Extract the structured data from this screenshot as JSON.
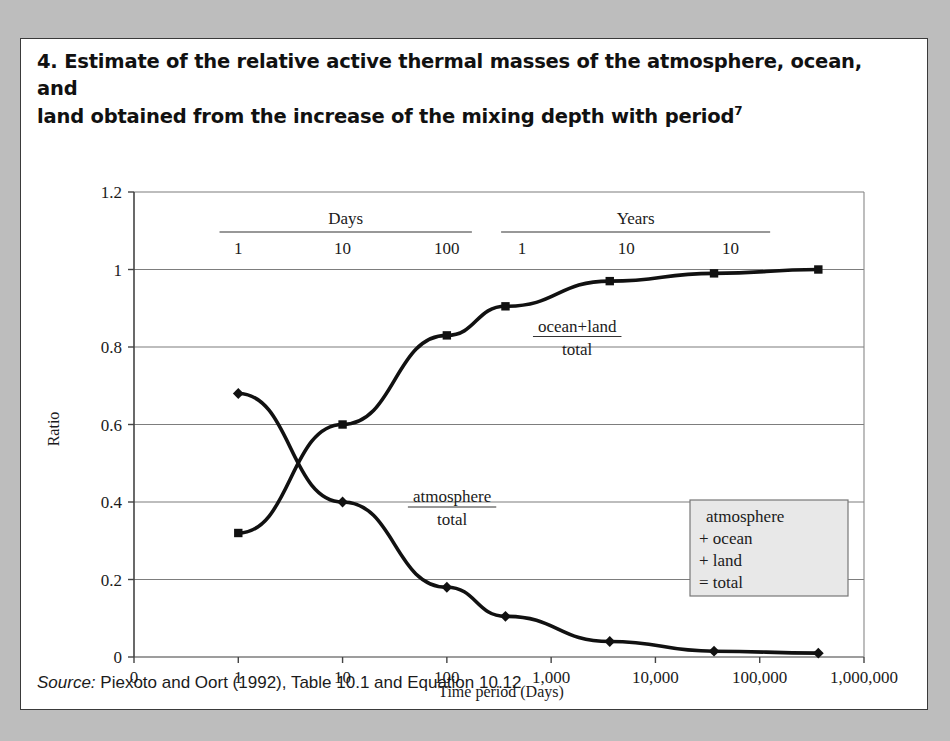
{
  "figure": {
    "number": "4.",
    "title": "4.  Estimate of the relative active thermal masses of the atmosphere, ocean, and land obtained from the increase of the mixing depth with period",
    "title_line1": "4.  Estimate of the relative active thermal masses of the atmosphere, ocean, and",
    "title_line2": "land obtained from the increase of the mixing depth with period",
    "footnote_marker": "7",
    "source_label": "Source:",
    "source_text": " Piexoto and Oort (1992), Table 10.1 and Equation 10.12",
    "frame_color": "#3a3a3a",
    "background_color": "#ffffff",
    "page_background": "#bdbdbd"
  },
  "chart_data": {
    "type": "line",
    "title": "",
    "xlabel": "Time period (Days)",
    "ylabel": "Ratio",
    "xlim": [
      0,
      7
    ],
    "ylim": [
      0,
      1.2
    ],
    "ytick_values": [
      0,
      0.2,
      0.4,
      0.6,
      0.8,
      1,
      1.2
    ],
    "ytick_labels": [
      "0",
      "0.2",
      "0.4",
      "0.6",
      "0.8",
      "1",
      "1.2"
    ],
    "xtick_labels": [
      "0",
      "1",
      "10",
      "100",
      "1,000",
      "10,000",
      "100,000",
      "1,000,000"
    ],
    "grid": "horizontal",
    "legend_position": "inside-lower-right",
    "line_color": "#111111",
    "grid_color": "#7d7d7d",
    "axis_color": "#555555",
    "series": [
      {
        "name": "ocean+land / total",
        "marker": "square",
        "x_days": [
          1,
          10,
          100,
          365,
          3650,
          36500,
          365000
        ],
        "x_positions": [
          1,
          2,
          3,
          3.562,
          4.562,
          5.562,
          6.562
        ],
        "values": [
          0.32,
          0.6,
          0.83,
          0.905,
          0.97,
          0.99,
          1.0
        ]
      },
      {
        "name": "atmosphere / total",
        "marker": "diamond",
        "x_days": [
          1,
          10,
          100,
          365,
          3650,
          36500,
          365000
        ],
        "x_positions": [
          1,
          2,
          3,
          3.562,
          4.562,
          5.562,
          6.562
        ],
        "values": [
          0.68,
          0.4,
          0.18,
          0.105,
          0.04,
          0.015,
          0.01
        ]
      }
    ],
    "annotations": [
      {
        "id": "ocean-land-total",
        "numerator": "ocean+land",
        "denominator": "total",
        "x_position": 4.25,
        "y_value": 0.84
      },
      {
        "id": "atmosphere-total",
        "numerator": "atmosphere",
        "denominator": "total",
        "x_position": 3.05,
        "y_value": 0.4
      }
    ],
    "period_scales": [
      {
        "name": "Days",
        "label": "Days",
        "ticks": [
          {
            "label": "1",
            "x_position": 1
          },
          {
            "label": "10",
            "x_position": 2
          },
          {
            "label": "100",
            "x_position": 3
          }
        ],
        "bar_start": 0.82,
        "bar_end": 3.24
      },
      {
        "name": "Years",
        "label": "Years",
        "ticks": [
          {
            "label": "1",
            "x_position": 3.72
          },
          {
            "label": "10",
            "x_position": 4.72
          },
          {
            "label": "10",
            "x_position": 5.72
          }
        ],
        "bar_start": 3.52,
        "bar_end": 6.1
      }
    ],
    "legend_box": {
      "lines": [
        "atmosphere",
        "+ ocean",
        "+ land",
        "= total"
      ],
      "fill": "#e8e8e8",
      "border": "#777777"
    }
  }
}
